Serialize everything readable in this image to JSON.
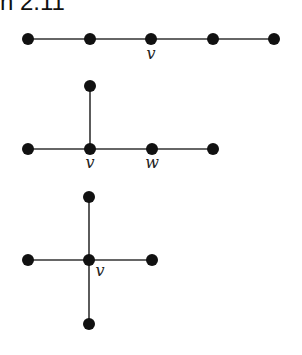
{
  "caption": "n 2.11",
  "style": {
    "node_color": "#111111",
    "edge_color": "#333333",
    "node_radius": 6
  },
  "graphs": [
    {
      "name": "path-graph",
      "nodes": [
        {
          "id": "a",
          "x": 28,
          "y": 39
        },
        {
          "id": "b",
          "x": 90,
          "y": 39
        },
        {
          "id": "v",
          "x": 151,
          "y": 39,
          "label": "v",
          "lx": 151,
          "ly": 59
        },
        {
          "id": "d",
          "x": 213,
          "y": 39
        },
        {
          "id": "e",
          "x": 274,
          "y": 39
        }
      ],
      "edges": [
        [
          "a",
          "b"
        ],
        [
          "b",
          "v"
        ],
        [
          "v",
          "d"
        ],
        [
          "d",
          "e"
        ]
      ]
    },
    {
      "name": "spider-graph",
      "nodes": [
        {
          "id": "t",
          "x": 90,
          "y": 86
        },
        {
          "id": "l",
          "x": 28,
          "y": 149
        },
        {
          "id": "v",
          "x": 90,
          "y": 149,
          "label": "v",
          "lx": 90,
          "ly": 168
        },
        {
          "id": "w",
          "x": 152,
          "y": 149,
          "label": "w",
          "lx": 152,
          "ly": 168
        },
        {
          "id": "r",
          "x": 213,
          "y": 149
        }
      ],
      "edges": [
        [
          "t",
          "v"
        ],
        [
          "l",
          "v"
        ],
        [
          "v",
          "w"
        ],
        [
          "w",
          "r"
        ]
      ]
    },
    {
      "name": "star-graph",
      "nodes": [
        {
          "id": "t",
          "x": 89,
          "y": 197
        },
        {
          "id": "l",
          "x": 28,
          "y": 260
        },
        {
          "id": "v",
          "x": 89,
          "y": 260,
          "label": "v",
          "lx": 100,
          "ly": 276
        },
        {
          "id": "r",
          "x": 152,
          "y": 260
        },
        {
          "id": "b",
          "x": 89,
          "y": 324
        }
      ],
      "edges": [
        [
          "t",
          "v"
        ],
        [
          "l",
          "v"
        ],
        [
          "v",
          "r"
        ],
        [
          "v",
          "b"
        ]
      ]
    }
  ]
}
